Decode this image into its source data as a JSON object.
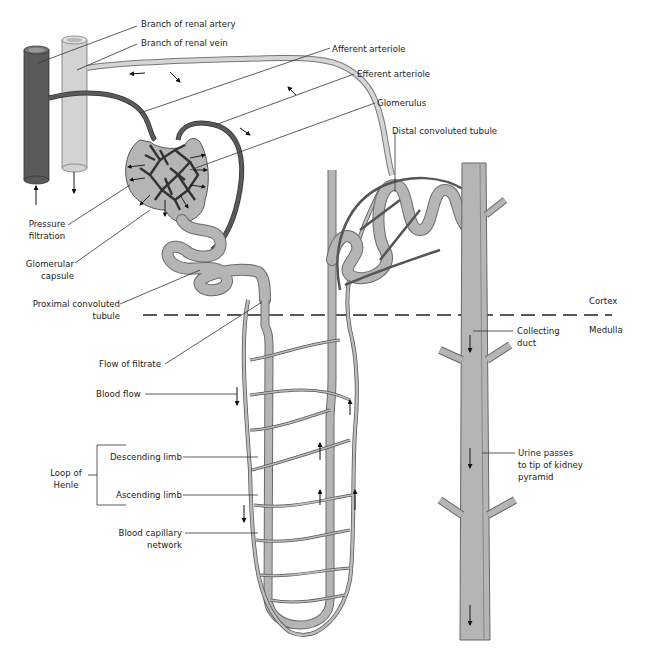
{
  "colors": {
    "artery": "#5a5a5a",
    "vein": "#cfcfcf",
    "tubule": "#b5b5b5",
    "tubule_outline": "#6a6a6a",
    "capillary": "#bdbdbd",
    "capillary_outline": "#555555",
    "label_text": "#222222",
    "leader_line": "#333333"
  },
  "labels": {
    "branch_renal_artery": "Branch of renal artery",
    "branch_renal_vein": "Branch of renal vein",
    "afferent_arteriole": "Afferent arteriole",
    "efferent_arteriole": "Efferent arteriole",
    "glomerulus": "Glomerulus",
    "distal_convoluted_tubule": "Distal convoluted tubule",
    "pressure_filtration": [
      "Pressure",
      "filtration"
    ],
    "glomerular_capsule": [
      "Glomerular",
      "capsule"
    ],
    "proximal_convoluted_tubule": [
      "Proximal convoluted",
      "tubule"
    ],
    "cortex": "Cortex",
    "medulla": "Medulla",
    "collecting_duct": [
      "Collecting",
      "duct"
    ],
    "flow_of_filtrate": "Flow of filtrate",
    "blood_flow": "Blood flow",
    "loop_of_henle": [
      "Loop of",
      "Henle"
    ],
    "descending_limb": "Descending limb",
    "ascending_limb": "Ascending limb",
    "blood_capillary_network": [
      "Blood capillary",
      "network"
    ],
    "urine_passes": [
      "Urine passes",
      "to tip of kidney",
      "pyramid"
    ]
  }
}
